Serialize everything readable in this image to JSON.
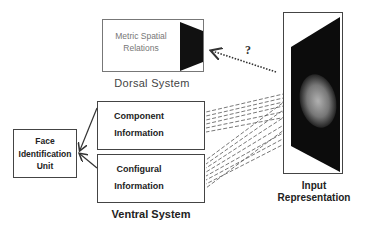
{
  "diagram": {
    "dorsal": {
      "box_text_line1": "Metric Spatial",
      "box_text_line2": "Relations",
      "system_label": "Dorsal System"
    },
    "ventral": {
      "component_line1": "Component",
      "component_line2": "Information",
      "configural_line1": "Configural",
      "configural_line2": "Information",
      "system_label": "Ventral System"
    },
    "face_id": {
      "line1": "Face",
      "line2": "Identification",
      "line3": "Unit"
    },
    "input": {
      "line1": "Input",
      "line2": "Representation"
    },
    "question_mark": "?"
  }
}
